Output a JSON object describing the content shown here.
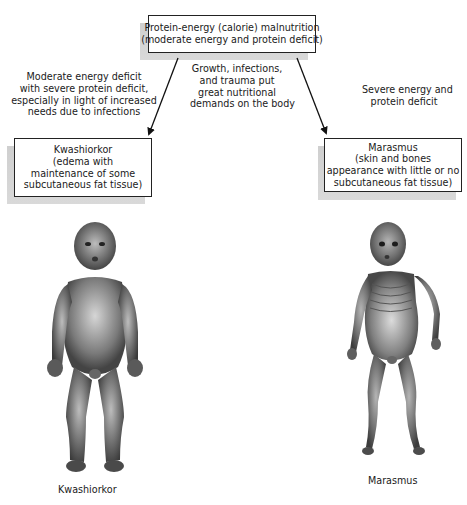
{
  "diagram": {
    "top_box": {
      "lines": [
        "Protein-energy (calorie) malnutrition",
        "(moderate energy and protein deficit)"
      ]
    },
    "left_note": {
      "lines": [
        "Moderate energy deficit",
        "with severe protein deficit,",
        "especially in light of increased",
        "needs due to infections"
      ]
    },
    "middle_note": {
      "lines": [
        "Growth, infections,",
        "and trauma put",
        "great nutritional",
        "demands on the body"
      ]
    },
    "right_note": {
      "lines": [
        "Severe energy and",
        "protein deficit"
      ]
    },
    "left_box": {
      "lines": [
        "Kwashiorkor",
        "(edema with",
        "maintenance of some",
        "subcutaneous fat tissue)"
      ]
    },
    "right_box": {
      "lines": [
        "Marasmus",
        "(skin and bones",
        "appearance with little or no",
        "subcutaneous fat tissue)"
      ]
    },
    "figures": {
      "left": {
        "icon": "edematous-child-illustration",
        "caption": "Kwashiorkor"
      },
      "right": {
        "icon": "emaciated-child-illustration",
        "caption": "Marasmus"
      }
    },
    "colors": {
      "border": "#222222",
      "shadow": "#d0d0d0",
      "skin": "#6e6e6e"
    }
  }
}
